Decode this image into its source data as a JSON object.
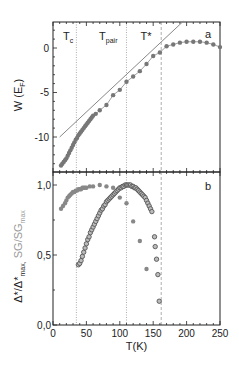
{
  "chart_data": [
    {
      "panel": "a",
      "type": "scatter",
      "title": "",
      "panel_label": "a",
      "xlabel": "",
      "ylabel": "W (E_F)",
      "ylabel_main": "W (E",
      "ylabel_sub": "F",
      "ylabel_close": ")",
      "xlim": [
        0,
        250
      ],
      "ylim": [
        -14,
        3
      ],
      "yticks": [
        0,
        -5,
        -10
      ],
      "ytick_labels": [
        "0",
        "-5",
        "-10"
      ],
      "grid": false,
      "series": [
        {
          "name": "W(T)",
          "marker": "filled-circle",
          "color": "#777777",
          "x": [
            12,
            14,
            16,
            18,
            20,
            22,
            24,
            26,
            28,
            30,
            32,
            34,
            36,
            38,
            40,
            42,
            44,
            46,
            48,
            50,
            52,
            54,
            56,
            58,
            60,
            64,
            70,
            80,
            90,
            100,
            110,
            120,
            130,
            140,
            150,
            160,
            170,
            180,
            190,
            200,
            210,
            220,
            230,
            240,
            250
          ],
          "y": [
            -13.2,
            -13.0,
            -12.8,
            -12.6,
            -12.4,
            -12.1,
            -11.8,
            -11.5,
            -11.2,
            -10.9,
            -10.6,
            -10.3,
            -10.1,
            -9.8,
            -9.6,
            -9.4,
            -9.2,
            -9.0,
            -8.8,
            -8.6,
            -8.4,
            -8.2,
            -8.0,
            -7.8,
            -7.6,
            -7.4,
            -7.0,
            -6.4,
            -5.3,
            -4.7,
            -3.8,
            -3.2,
            -2.6,
            -1.8,
            -0.9,
            -0.5,
            0.2,
            0.4,
            0.6,
            0.7,
            0.7,
            0.7,
            0.6,
            0.4,
            0.1
          ]
        },
        {
          "name": "linear fit",
          "marker": "line",
          "color": "#888888",
          "x": [
            10,
            195
          ],
          "y": [
            -10.0,
            3.0
          ]
        }
      ],
      "vlines": [
        {
          "label": "T_c",
          "x": 35,
          "style": "dotted"
        },
        {
          "label": "T_pair",
          "x": 110,
          "style": "dotted"
        },
        {
          "label": "T*",
          "x": 162,
          "style": "dashed"
        }
      ],
      "annotations": [
        {
          "text": "T",
          "sub": "c",
          "x": 12
        },
        {
          "text": "T",
          "sub": "pair",
          "x": 75
        },
        {
          "text": "T*",
          "sub": "",
          "x": 137
        }
      ]
    },
    {
      "panel": "b",
      "type": "scatter",
      "title": "",
      "panel_label": "b",
      "xlabel": "T(K)",
      "ylabel": "Δ*/Δ*max, SG/SGmax",
      "ylabel_part1": "Δ*/Δ*",
      "ylabel_part1_sub": "max,",
      "ylabel_part2": " SG/SG",
      "ylabel_part2_sub": "max",
      "xlim": [
        0,
        250
      ],
      "ylim": [
        0,
        1.1
      ],
      "xticks": [
        0,
        50,
        100,
        150,
        200,
        250
      ],
      "xtick_labels": [
        "0",
        "50",
        "100",
        "150",
        "200",
        "250"
      ],
      "yticks": [
        0.0,
        0.5,
        1.0
      ],
      "ytick_labels": [
        "0,0",
        "0,5",
        "1,0"
      ],
      "grid": false,
      "series": [
        {
          "name": "SG/SGmax",
          "marker": "filled-circle",
          "color": "#888888",
          "x": [
            12,
            15,
            18,
            20,
            22,
            24,
            26,
            28,
            30,
            32,
            34,
            36,
            38,
            40,
            42,
            44,
            46,
            48,
            50,
            55,
            60,
            70,
            80,
            90,
            100,
            110,
            120,
            130,
            140
          ],
          "y": [
            0.83,
            0.85,
            0.87,
            0.89,
            0.91,
            0.92,
            0.93,
            0.94,
            0.95,
            0.95,
            0.96,
            0.96,
            0.97,
            0.97,
            0.97,
            0.98,
            0.98,
            0.98,
            0.98,
            0.99,
            0.99,
            1.0,
            0.99,
            0.98,
            0.91,
            0.87,
            0.74,
            0.6,
            0.4
          ]
        },
        {
          "name": "Δ*/Δ*max",
          "marker": "open-circle",
          "color": "#555555",
          "x": [
            38,
            40,
            42,
            44,
            46,
            48,
            50,
            52,
            54,
            56,
            58,
            60,
            62,
            64,
            66,
            68,
            70,
            72,
            74,
            76,
            78,
            80,
            82,
            84,
            86,
            88,
            90,
            92,
            94,
            96,
            98,
            100,
            102,
            104,
            106,
            108,
            110,
            112,
            114,
            116,
            118,
            120,
            122,
            124,
            126,
            128,
            130,
            132,
            134,
            136,
            138,
            140,
            142,
            144,
            146,
            148,
            152,
            153,
            155,
            157,
            159
          ],
          "y": [
            0.43,
            0.44,
            0.46,
            0.49,
            0.52,
            0.55,
            0.58,
            0.61,
            0.63,
            0.66,
            0.68,
            0.7,
            0.72,
            0.74,
            0.76,
            0.78,
            0.8,
            0.82,
            0.83,
            0.85,
            0.86,
            0.88,
            0.89,
            0.9,
            0.91,
            0.92,
            0.93,
            0.94,
            0.95,
            0.96,
            0.97,
            0.98,
            0.98,
            0.99,
            0.99,
            1.0,
            1.0,
            1.0,
            1.0,
            1.0,
            0.99,
            0.99,
            0.98,
            0.98,
            0.97,
            0.96,
            0.95,
            0.94,
            0.93,
            0.92,
            0.91,
            0.89,
            0.87,
            0.85,
            0.83,
            0.81,
            0.63,
            0.56,
            0.47,
            0.36,
            0.17
          ]
        }
      ],
      "vlines": [
        {
          "label": "T_c",
          "x": 35,
          "style": "dotted"
        },
        {
          "label": "T_pair",
          "x": 110,
          "style": "dotted"
        },
        {
          "label": "T*",
          "x": 162,
          "style": "dashed"
        }
      ]
    }
  ]
}
